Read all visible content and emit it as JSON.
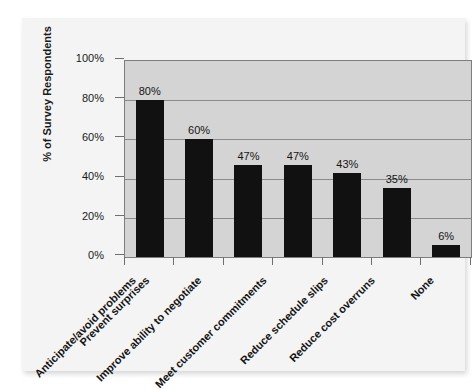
{
  "chart_data": {
    "type": "bar",
    "title": "",
    "subtitle": "",
    "xlabel": "",
    "ylabel": "% of Survey Respondents",
    "ylim": [
      0,
      100
    ],
    "ytick_labels": [
      "100%",
      "80%",
      "60%",
      "40%",
      "20%",
      "0%"
    ],
    "ytick_values": [
      100,
      80,
      60,
      40,
      20,
      0
    ],
    "grid": "horizontal",
    "legend": "none",
    "categories": [
      "Anticipate/avoid problems",
      "Prevent surprises",
      "Improve ability to negotiate",
      "Meet customer commitments",
      "Reduce schedule slips",
      "Reduce cost overruns",
      "None"
    ],
    "values": [
      80,
      60,
      47,
      47,
      43,
      35,
      6
    ],
    "data_labels": [
      "80%",
      "60%",
      "47%",
      "47%",
      "43%",
      "35%",
      "6%"
    ],
    "colors": {
      "bar": "#111111",
      "plot_background": "#d4d4d4",
      "gridline": "#8a8a8a",
      "axis": "#7d7d7d",
      "page_background": "#f4f4f4",
      "text": "#141414"
    }
  }
}
